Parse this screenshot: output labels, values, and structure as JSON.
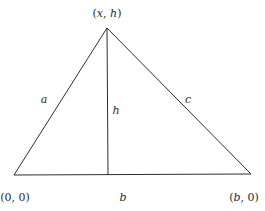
{
  "diagram": {
    "title": "",
    "vertices": {
      "apex": {
        "label": "(x, h)",
        "x": 107,
        "y": 28
      },
      "bottom_left": {
        "label": "(0, 0)",
        "x": 14,
        "y": 175
      },
      "bottom_right": {
        "label": "(b, 0)",
        "x": 251,
        "y": 174
      }
    },
    "altitude_foot": {
      "x": 108,
      "y": 175
    },
    "edges": {
      "left": {
        "label": "a"
      },
      "right": {
        "label": "c"
      },
      "base": {
        "label": "b"
      },
      "altitude": {
        "label": "h"
      }
    },
    "colors": {
      "line": "#2e2e2e",
      "text": "#2a2a2a",
      "background": "#ffffff"
    }
  }
}
